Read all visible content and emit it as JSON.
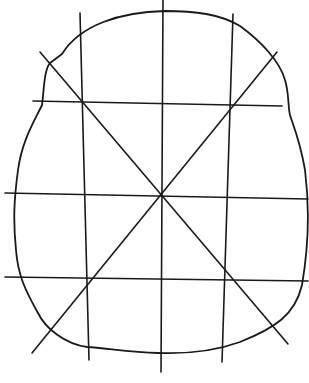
{
  "diagram": {
    "type": "hand-drawn sketch",
    "stroke_color": "#1a1a1a",
    "background_color": "#ffffff",
    "outline": {
      "shape": "rounded bell/shield shape, wider at bottom",
      "path": "M 62 54 C 80 25 120 12 165 11 C 195 11 220 14 240 26 C 262 42 280 62 285 80 C 289 92 288 108 290 115 C 292 122 300 140 305 170 C 310 210 308 250 302 285 C 295 315 275 328 240 342 C 215 351 185 354 158 353 C 130 352 105 348 87 347 C 65 344 45 328 38 313 C 25 290 18 275 16 250 C 13 220 14 200 18 170 C 22 140 35 120 42 105 C 44 90 44 70 50 63 Z"
    },
    "vertical_lines": [
      {
        "name": "left",
        "x1": 80,
        "y1": 13,
        "x2": 89,
        "y2": 360
      },
      {
        "name": "center",
        "x1": 163,
        "y1": 0,
        "x2": 161,
        "y2": 372
      },
      {
        "name": "right",
        "x1": 233,
        "y1": 14,
        "x2": 222,
        "y2": 362
      }
    ],
    "horizontal_lines": [
      {
        "name": "upper",
        "x1": 33,
        "y1": 101,
        "x2": 282,
        "y2": 106
      },
      {
        "name": "middle",
        "x1": 5,
        "y1": 193,
        "x2": 308,
        "y2": 199
      },
      {
        "name": "lower",
        "x1": 5,
        "y1": 277,
        "x2": 308,
        "y2": 281
      }
    ],
    "diagonals": [
      {
        "name": "top-left-to-bottom-right",
        "x1": 40,
        "y1": 52,
        "x2": 288,
        "y2": 344
      },
      {
        "name": "top-right-to-bottom-left",
        "x1": 277,
        "y1": 52,
        "x2": 32,
        "y2": 353
      }
    ],
    "center_point": {
      "x": 161,
      "y": 196
    }
  }
}
